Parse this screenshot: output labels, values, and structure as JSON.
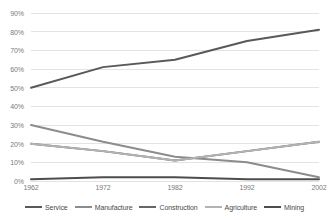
{
  "chart_data": {
    "type": "line",
    "title": "",
    "xlabel": "",
    "ylabel": "",
    "categories": [
      "1962",
      "1972",
      "1982",
      "1992",
      "2002"
    ],
    "x": [
      1962,
      1972,
      1982,
      1992,
      2002
    ],
    "ylim": [
      0,
      90
    ],
    "ytick_values": [
      0,
      10,
      20,
      30,
      40,
      50,
      60,
      70,
      80,
      90
    ],
    "ytick_labels": [
      "0%",
      "10%",
      "20%",
      "30%",
      "40%",
      "50%",
      "60%",
      "70%",
      "80%",
      "90%"
    ],
    "grid": true,
    "legend_position": "bottom",
    "series": [
      {
        "name": "Service",
        "color": "#595959",
        "values": [
          50,
          61,
          65,
          75,
          81
        ]
      },
      {
        "name": "Manufacture",
        "color": "#8c8c8c",
        "values": [
          30,
          21,
          13,
          10,
          2
        ]
      },
      {
        "name": "Construction",
        "color": "#666666",
        "values": [
          20,
          16,
          11,
          16,
          21
        ]
      },
      {
        "name": "Agriculture",
        "color": "#b3b3b3",
        "values": [
          20,
          16,
          11,
          16,
          21
        ]
      },
      {
        "name": "Mining",
        "color": "#4d4d4d",
        "values": [
          1,
          2,
          2,
          1,
          1
        ]
      }
    ],
    "axis_color": "#7b7b7b",
    "grid_color": "#e3e3e3",
    "background": "#ffffff"
  }
}
